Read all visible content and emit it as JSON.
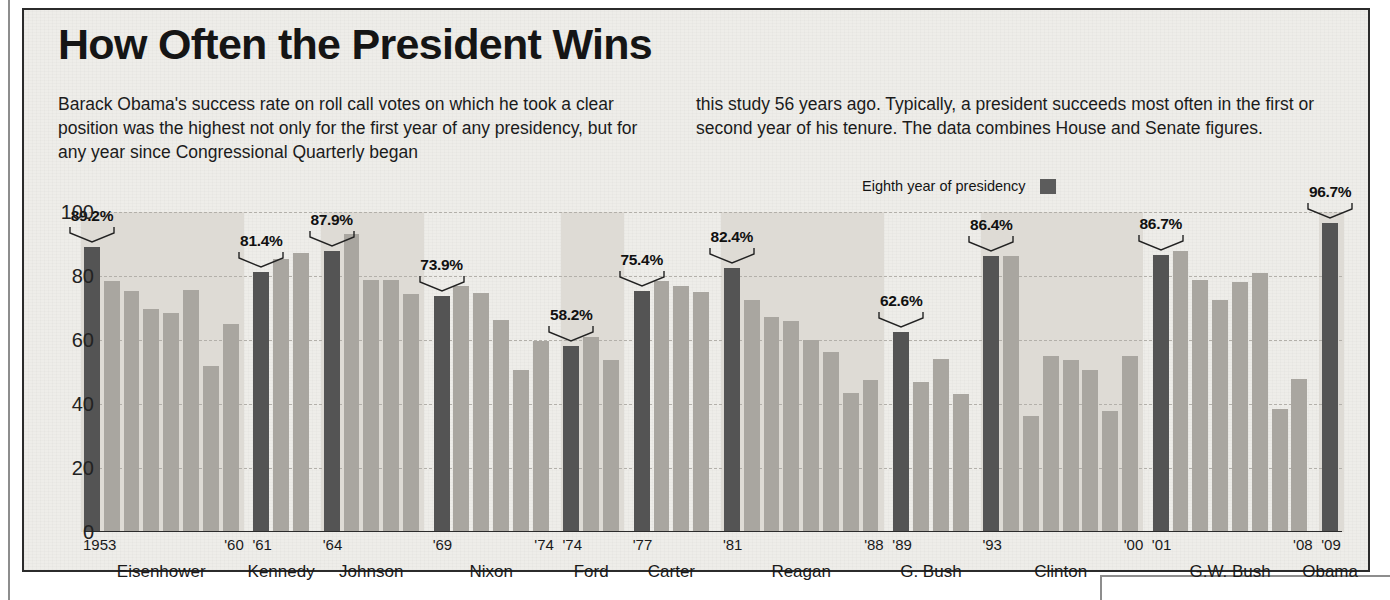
{
  "headline": "How Often the President Wins",
  "deck": {
    "col1": "Barack Obama's success rate on roll call votes on which he took a clear position was the highest not only for the first year of any presidency, but for any year since Congressional Quarterly began",
    "col2": "this study 56 years ago. Typically, a president succeeds most often in the first or second year of his tenure. The data combines House and Senate figures."
  },
  "legend": {
    "label": "Eighth year of presidency",
    "swatch_color": "#5c5c5c"
  },
  "colors": {
    "first_year_bar": "#545454",
    "other_year_bar": "#a9a6a0",
    "band": "#dedbd5",
    "paper": "#eeede9",
    "border": "#2b2b2b",
    "gridline": "#b3b0aa"
  },
  "chart_data": {
    "type": "bar",
    "title": "How Often the President Wins",
    "xlabel": "",
    "ylabel": "",
    "ylim": [
      0,
      100
    ],
    "yticks": [
      0,
      20,
      40,
      60,
      80,
      100
    ],
    "grid": true,
    "legend_position": "top-right",
    "note": "Dark bars mark the first year of each presidency and carry a labeled percentage.",
    "groups": [
      {
        "president": "Eisenhower",
        "start_label": "1953",
        "end_label": "'60",
        "band": true,
        "first_year_value": 89.2,
        "first_year_label": "89.2%",
        "years": [
          1953,
          1954,
          1955,
          1956,
          1957,
          1958,
          1959,
          1960
        ],
        "values": [
          89.2,
          78.3,
          75.3,
          69.7,
          68.4,
          75.7,
          52.0,
          65.1
        ]
      },
      {
        "president": "Kennedy",
        "start_label": "'61",
        "end_label": "",
        "band": false,
        "first_year_value": 81.4,
        "first_year_label": "81.4%",
        "years": [
          1961,
          1962,
          1963
        ],
        "values": [
          81.4,
          85.4,
          87.1
        ]
      },
      {
        "president": "Johnson",
        "start_label": "'64",
        "end_label": "",
        "band": true,
        "first_year_value": 87.9,
        "first_year_label": "87.9%",
        "years": [
          1964,
          1965,
          1966,
          1967,
          1968
        ],
        "values": [
          87.9,
          93.1,
          78.9,
          78.8,
          74.5
        ]
      },
      {
        "president": "Nixon",
        "start_label": "'69",
        "end_label": "'74",
        "band": false,
        "first_year_value": 73.9,
        "first_year_label": "73.9%",
        "years": [
          1969,
          1970,
          1971,
          1972,
          1973,
          1974
        ],
        "values": [
          73.9,
          76.9,
          74.8,
          66.3,
          50.6,
          59.6
        ]
      },
      {
        "president": "Ford",
        "start_label": "'74",
        "end_label": "",
        "band": true,
        "first_year_value": 58.2,
        "first_year_label": "58.2%",
        "years": [
          1974,
          1975,
          1976
        ],
        "values": [
          58.2,
          61.0,
          53.8
        ]
      },
      {
        "president": "Carter",
        "start_label": "'77",
        "end_label": "",
        "band": false,
        "first_year_value": 75.4,
        "first_year_label": "75.4%",
        "years": [
          1977,
          1978,
          1979,
          1980
        ],
        "values": [
          75.4,
          78.3,
          76.8,
          75.1
        ]
      },
      {
        "president": "Reagan",
        "start_label": "'81",
        "end_label": "'88",
        "band": true,
        "first_year_value": 82.4,
        "first_year_label": "82.4%",
        "years": [
          1981,
          1982,
          1983,
          1984,
          1985,
          1986,
          1987,
          1988
        ],
        "values": [
          82.4,
          72.4,
          67.1,
          65.8,
          59.9,
          56.1,
          43.5,
          47.4
        ]
      },
      {
        "president": "G. Bush",
        "start_label": "'89",
        "end_label": "",
        "band": false,
        "first_year_value": 62.6,
        "first_year_label": "62.6%",
        "years": [
          1989,
          1990,
          1991,
          1992
        ],
        "values": [
          62.6,
          46.8,
          54.2,
          43.0
        ]
      },
      {
        "president": "Clinton",
        "start_label": "'93",
        "end_label": "'00",
        "band": true,
        "first_year_value": 86.4,
        "first_year_label": "86.4%",
        "years": [
          1993,
          1994,
          1995,
          1996,
          1997,
          1998,
          1999,
          2000
        ],
        "values": [
          86.4,
          86.4,
          36.2,
          55.1,
          53.6,
          50.6,
          37.8,
          55.0
        ]
      },
      {
        "president": "G.W. Bush",
        "start_label": "'01",
        "end_label": "'08",
        "band": false,
        "first_year_value": 86.7,
        "first_year_label": "86.7%",
        "years": [
          2001,
          2002,
          2003,
          2004,
          2005,
          2006,
          2007,
          2008
        ],
        "values": [
          86.7,
          87.8,
          78.7,
          72.6,
          78.0,
          80.9,
          38.3,
          47.8
        ]
      },
      {
        "president": "Obama",
        "start_label": "'09",
        "end_label": "",
        "band": true,
        "first_year_value": 96.7,
        "first_year_label": "96.7%",
        "years": [
          2009
        ],
        "values": [
          96.7
        ]
      }
    ]
  }
}
